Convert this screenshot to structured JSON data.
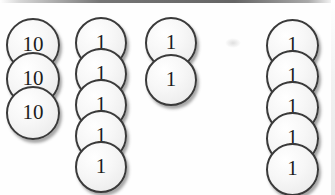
{
  "scene": {
    "width": 335,
    "height": 195,
    "background_color": "#fefefe",
    "description": "Place-value coin stacks",
    "coin_fill_color": "#f3f3f3",
    "coin_outline_color": "#3a3a3a",
    "label_color": "#1d1d1d"
  },
  "stacks": [
    {
      "name": "tens-stack",
      "label_value": "10",
      "count": 3,
      "left": 6,
      "top": 18,
      "coin_size": 54,
      "overlap_step": 34,
      "font_size": 21,
      "coins": [
        {
          "label": "10"
        },
        {
          "label": "10"
        },
        {
          "label": "10"
        }
      ]
    },
    {
      "name": "ones-stack-a",
      "label_value": "1",
      "count": 5,
      "left": 75,
      "top": 17,
      "coin_size": 52,
      "overlap_step": 31,
      "font_size": 21,
      "coins": [
        {
          "label": "1"
        },
        {
          "label": "1"
        },
        {
          "label": "1"
        },
        {
          "label": "1"
        },
        {
          "label": "1"
        }
      ]
    },
    {
      "name": "ones-stack-b",
      "label_value": "1",
      "count": 2,
      "left": 145,
      "top": 17,
      "coin_size": 52,
      "overlap_step": 37,
      "font_size": 21,
      "coins": [
        {
          "label": "1"
        },
        {
          "label": "1"
        }
      ]
    },
    {
      "name": "ones-stack-c",
      "label_value": "1",
      "count": 5,
      "left": 266,
      "top": 19,
      "coin_size": 53,
      "overlap_step": 31,
      "font_size": 21,
      "coins": [
        {
          "label": "1"
        },
        {
          "label": "1"
        },
        {
          "label": "1"
        },
        {
          "label": "1"
        },
        {
          "label": "1"
        }
      ]
    }
  ],
  "smudges": [
    {
      "left": 225,
      "top": 38
    }
  ]
}
